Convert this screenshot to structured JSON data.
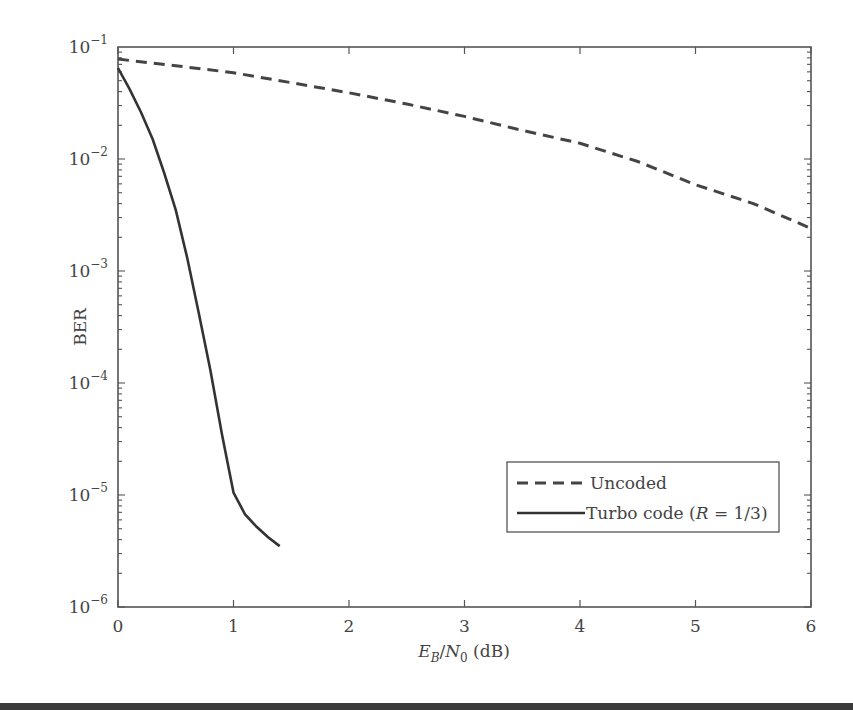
{
  "chart_data": {
    "type": "line",
    "title": "",
    "xlabel": "E_B/N_0 (dB)",
    "xlabel_parts": {
      "e": "E",
      "e_sub": "B",
      "slash": "/",
      "n": "N",
      "n_sub": "0",
      "unit": " (dB)"
    },
    "ylabel": "BER",
    "xlim": [
      0,
      6
    ],
    "ylim": [
      1e-06,
      0.1
    ],
    "yscale": "log",
    "grid": false,
    "legend_position": "lower right",
    "x_ticks": [
      "0",
      "1",
      "2",
      "3",
      "4",
      "5",
      "6"
    ],
    "y_ticks": [
      {
        "base": "10",
        "exp": "−1",
        "value": -1
      },
      {
        "base": "10",
        "exp": "−2",
        "value": -2
      },
      {
        "base": "10",
        "exp": "−3",
        "value": -3
      },
      {
        "base": "10",
        "exp": "−4",
        "value": -4
      },
      {
        "base": "10",
        "exp": "−5",
        "value": -5
      },
      {
        "base": "10",
        "exp": "−6",
        "value": -6
      }
    ],
    "series": [
      {
        "name": "Uncoded",
        "style": "dashed",
        "color": "#444444",
        "x": [
          0,
          0.5,
          1,
          1.5,
          2,
          2.5,
          3,
          3.5,
          4,
          4.5,
          5,
          5.5,
          6
        ],
        "values": [
          0.078,
          0.068,
          0.059,
          0.048,
          0.039,
          0.031,
          0.024,
          0.018,
          0.0138,
          0.0095,
          0.0059,
          0.004,
          0.0024
        ]
      },
      {
        "name": "Turbo code (R = 1/3)",
        "style": "solid",
        "color": "#333333",
        "x": [
          0,
          0.1,
          0.2,
          0.3,
          0.4,
          0.5,
          0.6,
          0.7,
          0.8,
          0.9,
          1.0,
          1.1,
          1.2,
          1.3,
          1.4
        ],
        "values": [
          0.065,
          0.042,
          0.026,
          0.015,
          0.0075,
          0.0035,
          0.0013,
          0.00042,
          0.00013,
          3.5e-05,
          1.05e-05,
          6.7e-06,
          5.2e-06,
          4.2e-06,
          3.5e-06
        ]
      }
    ],
    "legend": [
      {
        "label": "Uncoded",
        "style": "dashed"
      },
      {
        "label_prefix": "Turbo code (",
        "label_italic": "R",
        "label_suffix": " = 1/3)",
        "style": "solid"
      }
    ]
  }
}
